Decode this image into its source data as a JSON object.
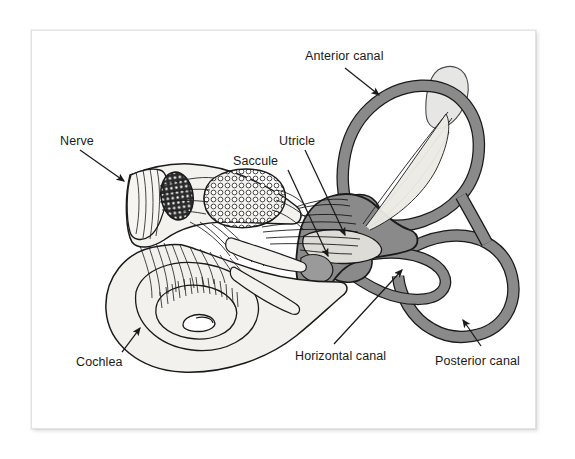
{
  "figure": {
    "type": "anatomical-illustration",
    "background_color": "#ffffff",
    "frame_border_color": "#e3e3e3",
    "ink_color": "#1a1a1a",
    "canal_fill_color": "#8a8a8a",
    "sac_fill_color": "#d9d9d9",
    "cochlea_fill_color": "#f2f1ee"
  },
  "labels": [
    {
      "id": "anterior-canal",
      "text": "Anterior canal",
      "x": 305,
      "y": 52,
      "leader": {
        "from": [
          345,
          68
        ],
        "to": [
          381,
          97
        ],
        "arrow": true
      }
    },
    {
      "id": "nerve",
      "text": "Nerve",
      "x": 60,
      "y": 137,
      "leader": {
        "from": [
          80,
          150
        ],
        "to": [
          126,
          183
        ],
        "arrow": true
      }
    },
    {
      "id": "utricle",
      "text": "Utricle",
      "x": 279,
      "y": 137,
      "leader": {
        "from": [
          305,
          150
        ],
        "to": [
          347,
          237
        ],
        "arrow": true
      }
    },
    {
      "id": "saccule",
      "text": "Saccule",
      "x": 233,
      "y": 157,
      "leader": {
        "from": [
          288,
          170
        ],
        "to": [
          330,
          258
        ],
        "arrow": true
      }
    },
    {
      "id": "cochlea",
      "text": "Cochlea",
      "x": 76,
      "y": 358,
      "leader": {
        "from": [
          122,
          352
        ],
        "to": [
          139,
          327
        ],
        "arrow": true
      }
    },
    {
      "id": "horizontal-canal",
      "text": "Horizontal canal",
      "x": 295,
      "y": 352,
      "leader": {
        "from": [
          334,
          344
        ],
        "to": [
          404,
          268
        ],
        "arrow": true
      }
    },
    {
      "id": "posterior-canal",
      "text": "Posterior canal",
      "x": 435,
      "y": 357,
      "leader": {
        "from": [
          481,
          346
        ],
        "to": [
          462,
          318
        ],
        "arrow": true
      }
    }
  ]
}
